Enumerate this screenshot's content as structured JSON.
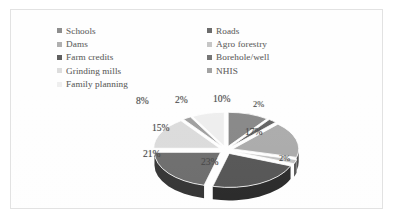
{
  "frame": {
    "border_color": "#e2e2e2",
    "background": "#ffffff"
  },
  "legend": {
    "columns": 2,
    "position": "top",
    "items": [
      {
        "label": "Schools",
        "color": "#808080",
        "swatch": "legend-swatch"
      },
      {
        "label": "Dams",
        "color": "#a6a6a6",
        "swatch": "legend-swatch"
      },
      {
        "label": "Farm credits",
        "color": "#4d4d4d",
        "swatch": "legend-swatch"
      },
      {
        "label": "Grinding mills",
        "color": "#d9d9d9",
        "swatch": "legend-swatch"
      },
      {
        "label": "Family planning",
        "color": "#ededed",
        "swatch": "legend-swatch"
      },
      {
        "label": "Roads",
        "color": "#595959",
        "swatch": "legend-swatch"
      },
      {
        "label": "Agro forestry",
        "color": "#bfbfbf",
        "swatch": "legend-swatch"
      },
      {
        "label": "Borehole/well",
        "color": "#666666",
        "swatch": "legend-swatch"
      },
      {
        "label": "NHIS",
        "color": "#999999",
        "swatch": "legend-swatch"
      }
    ]
  },
  "labels": {
    "p_schools": "10%",
    "p_roads": "2%",
    "p_dams": "17%",
    "p_agro": "2%",
    "p_farm": "23%",
    "p_borehole": "21%",
    "p_grinding": "15%",
    "p_nhis": "2%",
    "p_family": "8%"
  },
  "chart_data": {
    "type": "pie",
    "title": "",
    "subtitle": "",
    "style": "3d-exploded",
    "legend_position": "top",
    "grid": false,
    "total": 100,
    "units": "percent",
    "categories": [
      "Schools",
      "Roads",
      "Dams",
      "Agro forestry",
      "Farm credits",
      "Borehole/well",
      "Grinding mills",
      "NHIS",
      "Family planning"
    ],
    "values": [
      10,
      2,
      17,
      2,
      23,
      21,
      15,
      2,
      8
    ],
    "data_labels": [
      "10%",
      "2%",
      "17%",
      "2%",
      "23%",
      "21%",
      "15%",
      "2%",
      "8%"
    ],
    "colors": [
      "#808080",
      "#595959",
      "#a6a6a6",
      "#bfbfbf",
      "#4d4d4d",
      "#666666",
      "#d9d9d9",
      "#999999",
      "#ededed"
    ],
    "slices": [
      {
        "name": "Schools",
        "value": 10,
        "label": "10%",
        "color": "#808080",
        "start_deg": 0,
        "end_deg": 36
      },
      {
        "name": "Roads",
        "value": 2,
        "label": "2%",
        "color": "#595959",
        "start_deg": 36,
        "end_deg": 43.2
      },
      {
        "name": "Dams",
        "value": 17,
        "label": "17%",
        "color": "#a6a6a6",
        "start_deg": 43.2,
        "end_deg": 104.4
      },
      {
        "name": "Agro forestry",
        "value": 2,
        "label": "2%",
        "color": "#bfbfbf",
        "start_deg": 104.4,
        "end_deg": 111.6
      },
      {
        "name": "Farm credits",
        "value": 23,
        "label": "23%",
        "color": "#4d4d4d",
        "start_deg": 111.6,
        "end_deg": 194.4
      },
      {
        "name": "Borehole/well",
        "value": 21,
        "label": "21%",
        "color": "#666666",
        "start_deg": 194.4,
        "end_deg": 270
      },
      {
        "name": "Grinding mills",
        "value": 15,
        "label": "15%",
        "color": "#d9d9d9",
        "start_deg": 270,
        "end_deg": 324
      },
      {
        "name": "NHIS",
        "value": 2,
        "label": "2%",
        "color": "#999999",
        "start_deg": 324,
        "end_deg": 331.2
      },
      {
        "name": "Family planning",
        "value": 8,
        "label": "8%",
        "color": "#ededed",
        "start_deg": 331.2,
        "end_deg": 360
      }
    ]
  }
}
